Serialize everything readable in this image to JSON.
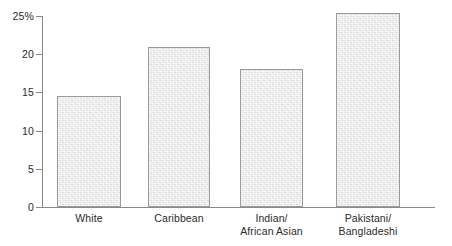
{
  "chart_data": {
    "type": "bar",
    "title": "",
    "subtitle": "",
    "xlabel": "",
    "ylabel": "",
    "categories": [
      "White",
      "Caribbean",
      "Indian/\nAfrican Asian",
      "Pakistani/\nBangladeshi"
    ],
    "values": [
      14.5,
      21.0,
      18.0,
      25.4
    ],
    "ylim": [
      0,
      25
    ],
    "yticks": [
      0,
      5,
      10,
      15,
      20,
      25
    ],
    "ytick_labels": [
      "0",
      "5",
      "10",
      "15",
      "20",
      "25%"
    ],
    "grid": false,
    "legend": null,
    "units": "percent",
    "bar_fill_color": "#e6e6e6",
    "bar_border_color": "#9a9a9a",
    "axis_color": "#8a8a8a",
    "text_color": "#2b2b2b"
  }
}
